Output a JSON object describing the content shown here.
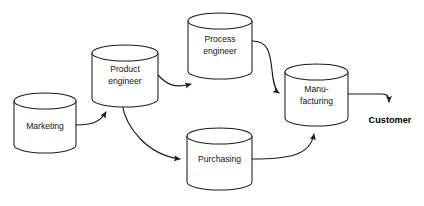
{
  "diagram": {
    "type": "flowchart",
    "background_color": "#ffffff",
    "stroke_color": "#1b1b1b",
    "text_color": "#141414",
    "node_shape": "cylinder",
    "nodes": [
      {
        "id": "marketing",
        "label_lines": [
          "Marketing"
        ],
        "shape": "cylinder",
        "x": 14,
        "y": 93,
        "width": 62,
        "height": 60,
        "ellipse_ry": 8
      },
      {
        "id": "product-engineer",
        "label_lines": [
          "Product",
          "engineer"
        ],
        "shape": "cylinder",
        "x": 92,
        "y": 45,
        "width": 66,
        "height": 62,
        "ellipse_ry": 8
      },
      {
        "id": "process-engineer",
        "label_lines": [
          "Process",
          "engineer"
        ],
        "shape": "cylinder",
        "x": 188,
        "y": 13,
        "width": 64,
        "height": 66,
        "ellipse_ry": 8
      },
      {
        "id": "manufacturing",
        "label_lines": [
          "Manu-",
          "facturing"
        ],
        "shape": "cylinder",
        "x": 285,
        "y": 64,
        "width": 63,
        "height": 62,
        "ellipse_ry": 8
      },
      {
        "id": "purchasing",
        "label_lines": [
          "Purchasing"
        ],
        "shape": "cylinder",
        "x": 187,
        "y": 128,
        "width": 65,
        "height": 62,
        "ellipse_ry": 8
      }
    ],
    "terminals": [
      {
        "id": "customer",
        "label": "Customer",
        "bold": true,
        "x": 390,
        "y": 121
      }
    ],
    "edges": [
      {
        "id": "marketing-to-product-engineer",
        "from": "marketing",
        "to": "product-engineer",
        "arrow": true
      },
      {
        "id": "product-engineer-to-process-engineer",
        "from": "product-engineer",
        "to": "process-engineer",
        "arrow": true
      },
      {
        "id": "product-engineer-to-purchasing",
        "from": "product-engineer",
        "to": "purchasing",
        "arrow": true
      },
      {
        "id": "process-engineer-to-manufacturing",
        "from": "process-engineer",
        "to": "manufacturing",
        "arrow": true
      },
      {
        "id": "purchasing-to-manufacturing",
        "from": "purchasing",
        "to": "manufacturing",
        "arrow": true
      },
      {
        "id": "manufacturing-to-customer",
        "from": "manufacturing",
        "to": "customer",
        "arrow": true
      }
    ]
  }
}
